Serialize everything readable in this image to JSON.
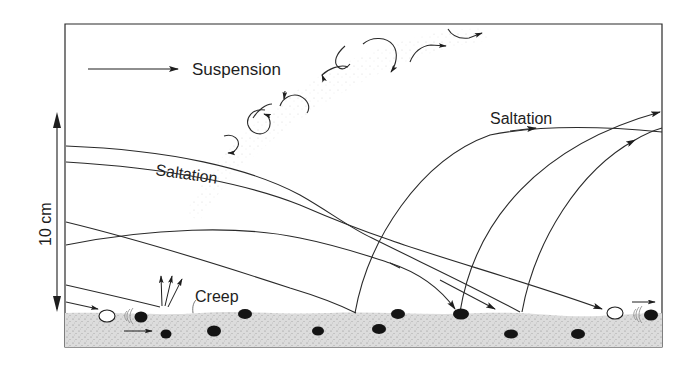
{
  "diagram": {
    "labels": {
      "suspension": "Suspension",
      "saltation_left": "Saltation",
      "saltation_right": "Saltation",
      "creep": "Creep",
      "scale": "10 cm"
    },
    "colors": {
      "ink": "#1e1e1e",
      "ground": "#d9d9d9",
      "background": "#ffffff"
    },
    "elements": [
      {
        "name": "wind-direction-arrow",
        "description": "horizontal arrow indicating wind direction"
      },
      {
        "name": "suspension-eddies",
        "description": "chain of turbulent eddies rising diagonally"
      },
      {
        "name": "saltation-trajectories",
        "description": "curved grain paths arcing and impacting the bed"
      },
      {
        "name": "creep-grains",
        "description": "surface grains pushed along by impacts"
      },
      {
        "name": "sand-bed",
        "description": "stippled ground layer with embedded dark grains"
      },
      {
        "name": "scale-bar",
        "description": "vertical double arrow, 10 cm"
      }
    ]
  }
}
